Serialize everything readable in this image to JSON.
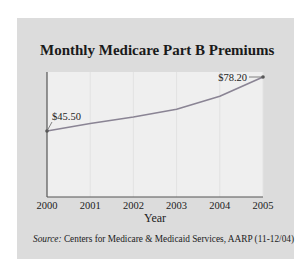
{
  "chart_data": {
    "type": "line",
    "title": "Monthly Medicare Part B Premiums",
    "xlabel": "Year",
    "ylabel": "",
    "categories": [
      "2000",
      "2001",
      "2002",
      "2003",
      "2004",
      "2005"
    ],
    "series": [
      {
        "name": "Monthly Premium ($)",
        "values": [
          45.5,
          50.0,
          54.0,
          58.7,
          66.6,
          78.2
        ]
      }
    ],
    "annotations": [
      {
        "x": "2000",
        "label": "$45.50"
      },
      {
        "x": "2005",
        "label": "$78.20"
      }
    ],
    "grid": {
      "vertical": true,
      "horizontal": false
    },
    "legend": null,
    "source_prefix": "Source:",
    "source_text": " Centers for Medicare & Medicaid Services, AARP (11-12/04)"
  },
  "colors": {
    "panel": "#dcdcdc",
    "plot_background": "#efefef",
    "line": "#8a8494",
    "axis": "#555555",
    "grid": "#e2e2e2"
  }
}
